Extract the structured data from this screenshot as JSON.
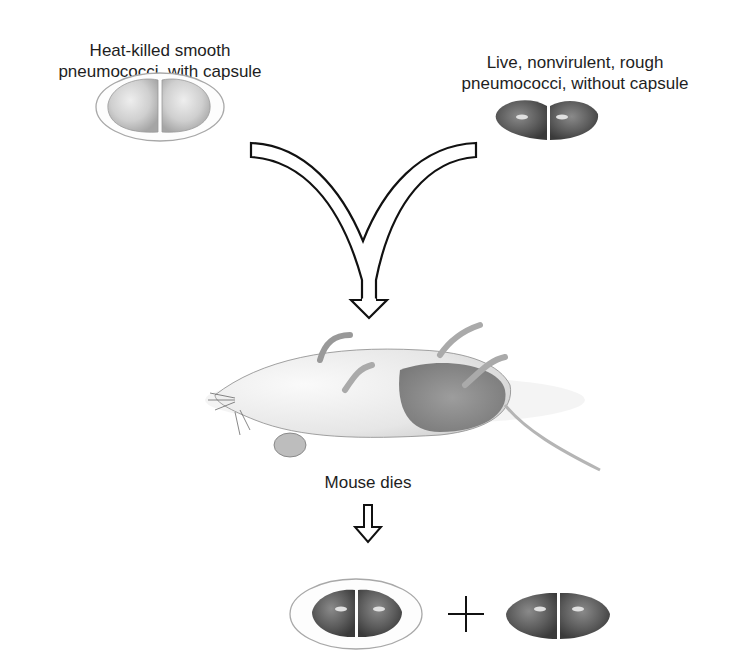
{
  "diagram": {
    "title_left": "Heat-killed smooth\npneumococci, with capsule",
    "title_right": "Live, nonvirulent, rough\npneumococci, without capsule",
    "result_label": "Mouse dies",
    "plus_sign": "+",
    "elements": {
      "left_bacterium": "encapsulated-diplococcus-light",
      "right_bacterium": "unencapsulated-diplococcus-dark",
      "merge_arrow": "converging-outline-arrow",
      "mouse": "dead-mouse-on-back",
      "down_arrow": "outline-down-arrow",
      "result_left": "encapsulated-diplococcus-dark",
      "result_right": "unencapsulated-diplococcus-dark"
    },
    "colors": {
      "light_cell": "#c9c9c9",
      "dark_cell": "#5a5a5a",
      "capsule_outline": "#9a9a9a",
      "arrow_outline": "#111111"
    }
  }
}
